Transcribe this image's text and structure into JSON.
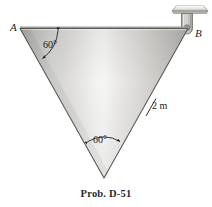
{
  "figure": {
    "caption": "Prob. D-51",
    "vertices": [
      {
        "name": "A",
        "label": "A"
      },
      {
        "name": "B",
        "label": "B"
      }
    ],
    "angles": [
      {
        "name": "angle-at-a",
        "label": "60°",
        "value": 60,
        "unit": "deg"
      },
      {
        "name": "angle-at-apex",
        "label": "60°",
        "value": 60,
        "unit": "deg"
      }
    ],
    "dimensions": [
      {
        "name": "side-b-to-apex",
        "label": "2 m",
        "value": 2,
        "unit": "m"
      }
    ],
    "colors": {
      "outline": "#4a4a4a",
      "plate_light": "#f2f2f0",
      "plate_mid": "#c9c9c6",
      "plate_dark": "#9a9a97",
      "bracket": "#c4c4c0",
      "ceiling": "#d9d9d6",
      "text": "#1b1b1b",
      "background": "#ffffff"
    },
    "icons": {
      "ceiling_plate": "ceiling-plate-icon",
      "pin_support": "pin-support-icon",
      "pin_bolt": "pin-bolt-icon"
    }
  }
}
